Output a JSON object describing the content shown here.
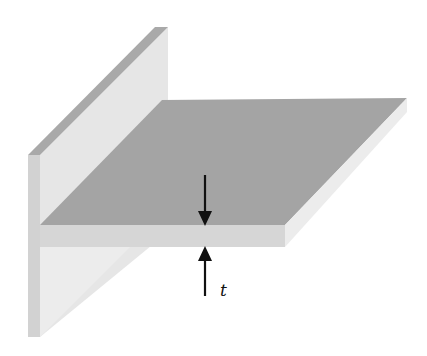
{
  "figure": {
    "labels": {
      "thickness": "t"
    },
    "colors": {
      "background": "#ffffff",
      "wall_face": "#e6e6e6",
      "wall_top_edge": "#a9a9a9",
      "wall_front_edge": "#d2d2d2",
      "plate_top": "#a4a4a4",
      "plate_front_edge": "#d6d6d6",
      "plate_side_edge": "#ececec",
      "arrow": "#111111"
    }
  }
}
